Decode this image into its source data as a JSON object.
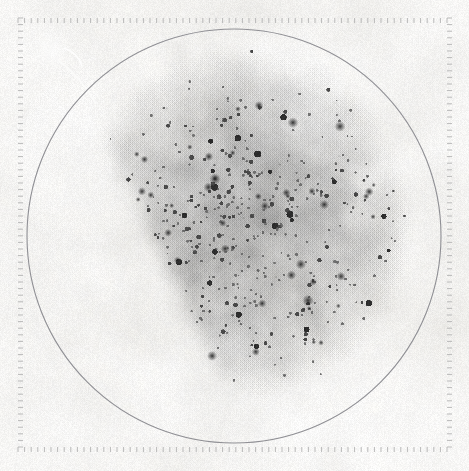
{
  "viewer": {
    "width": 469,
    "height": 471,
    "background_color": "#ffffff",
    "name": "photographic-plate-scan"
  },
  "plate": {
    "paper_base_color": "#eceae5",
    "paper_highlight_color": "#f4f3f0",
    "paper_shadow_color": "#e2e0da",
    "frame": {
      "left": 18,
      "top": 18,
      "right": 452,
      "bottom": 452,
      "tick_color": "#b9b9b9",
      "tick_length": 5,
      "tick_spacing": 6.6,
      "tick_width": 1
    },
    "circle": {
      "label": "plate-aperture-circle",
      "center_x": 234,
      "center_y": 236,
      "radius": 207,
      "stroke_color": "#8f8f94",
      "stroke_width": 1.1
    },
    "exposed_field": {
      "label": "exposed-emulsion-field",
      "center_x": 243,
      "center_y": 222,
      "radius_x": 162,
      "radius_y": 168,
      "grain_color_dark": "#2e2e2e",
      "grain_color_mid": "#6e6e6e",
      "cut_edge": {
        "label": "straight-cut-edge-lower-left",
        "x1": 98,
        "y1": 118,
        "x2": 232,
        "y2": 398,
        "description": "sharp straight boundary of emulsion on lower-left"
      }
    },
    "artifacts": [
      {
        "name": "scratch-streak-upper-left",
        "x1": 64,
        "y1": 48,
        "x2": 82,
        "y2": 66,
        "color": "#ffffff"
      },
      {
        "name": "scratch-streak-upper-left-2",
        "x1": 58,
        "y1": 60,
        "x2": 96,
        "y2": 104,
        "color": "#fbfbfa"
      },
      {
        "name": "smudge-upper-left",
        "x": 52,
        "y": 52,
        "r": 22,
        "color": "#f6f5f2"
      }
    ]
  },
  "caption": {
    "text": "",
    "visible": false
  },
  "chart_data": {
    "type": "scatter",
    "title": "",
    "xlabel": "",
    "ylabel": "",
    "grid": false,
    "legend": null,
    "axis_frame": {
      "tick_marks_only": true,
      "sides": [
        "top",
        "right",
        "bottom",
        "left"
      ],
      "tick_count_per_side": 66,
      "tick_labels": []
    },
    "xlim": [
      0,
      469
    ],
    "ylim": [
      0,
      471
    ],
    "points_model": {
      "distribution": "clustered-fractal",
      "n_points": 26000,
      "cluster_seeds": 170,
      "field_center": [
        243,
        222
      ],
      "field_radius": 165,
      "density_falloff": "radial-gaussian",
      "clipped_by_straight_edge": true
    }
  }
}
